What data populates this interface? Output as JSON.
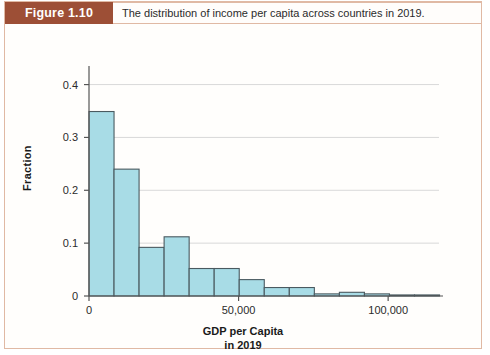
{
  "figure": {
    "badge_label": "Figure 1.10",
    "title": "The distribution of income per capita across countries in 2019.",
    "badge_color": "#9d4f36",
    "border_color": "#e0b9a4"
  },
  "chart_data": {
    "type": "bar",
    "title": "The distribution of income per capita across countries in 2019.",
    "xlabel_line1": "GDP per Capita",
    "xlabel_line2": "in 2019",
    "ylabel": "Fraction",
    "xlim": [
      0,
      117000
    ],
    "ylim": [
      0,
      0.42
    ],
    "bin_width": 8370,
    "grid": "horizontal",
    "legend": "none",
    "bar_fill": "#a8dce6",
    "bar_stroke": "#4a5a60",
    "x_ticks": [
      0,
      50000,
      100000
    ],
    "x_tick_labels": [
      "0",
      "50,000",
      "100,000"
    ],
    "y_ticks": [
      0,
      0.1,
      0.2,
      0.3,
      0.4
    ],
    "y_tick_labels": [
      "0",
      "0.1",
      "0.2",
      "0.3",
      "0.4"
    ],
    "bins": [
      {
        "x0": 0,
        "x1": 8370,
        "value": 0.349
      },
      {
        "x0": 8370,
        "x1": 16740,
        "value": 0.24
      },
      {
        "x0": 16740,
        "x1": 25110,
        "value": 0.092
      },
      {
        "x0": 25110,
        "x1": 33480,
        "value": 0.112
      },
      {
        "x0": 33480,
        "x1": 41850,
        "value": 0.052
      },
      {
        "x0": 41850,
        "x1": 50220,
        "value": 0.052
      },
      {
        "x0": 50220,
        "x1": 58590,
        "value": 0.031
      },
      {
        "x0": 58590,
        "x1": 66960,
        "value": 0.016
      },
      {
        "x0": 66960,
        "x1": 75330,
        "value": 0.016
      },
      {
        "x0": 75330,
        "x1": 83700,
        "value": 0.004
      },
      {
        "x0": 83700,
        "x1": 92070,
        "value": 0.007
      },
      {
        "x0": 92070,
        "x1": 100440,
        "value": 0.004
      },
      {
        "x0": 100440,
        "x1": 108810,
        "value": 0.002
      },
      {
        "x0": 108810,
        "x1": 117180,
        "value": 0.002
      }
    ]
  }
}
